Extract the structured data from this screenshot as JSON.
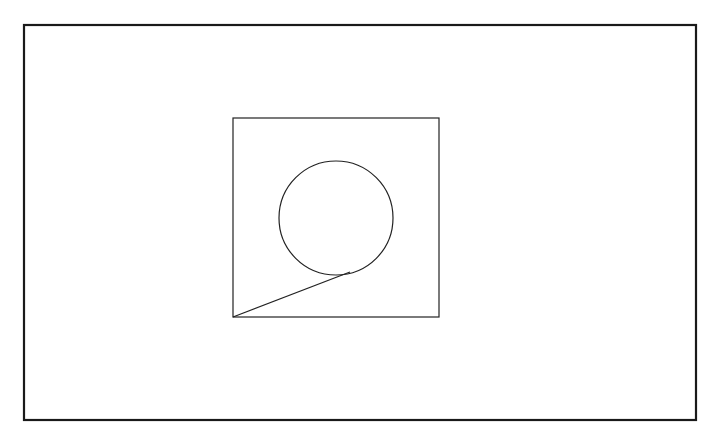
{
  "canvas": {
    "width": 718,
    "height": 436,
    "background": "#ffffff"
  },
  "colors": {
    "stroke": "#222222",
    "frame_stroke": "#1a1a1a"
  },
  "diagram": {
    "outer_frame": {
      "x": 24,
      "y": 25,
      "width": 672,
      "height": 395,
      "stroke_width": 2.2
    },
    "square": {
      "x": 233,
      "y": 118,
      "width": 206,
      "height": 199,
      "stroke_width": 1.2
    },
    "circle": {
      "cx": 336,
      "cy": 218,
      "r": 57,
      "stroke_width": 1.2
    },
    "tangent_line": {
      "x1": 233,
      "y1": 317,
      "x2": 350,
      "y2": 272,
      "stroke_width": 1.2
    }
  }
}
